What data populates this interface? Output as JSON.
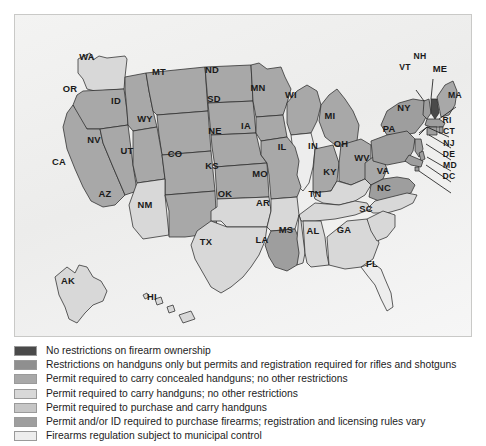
{
  "map": {
    "title": "United States firearm regulation by state",
    "background_color": "#efefee",
    "border_color": "#c9c9c7",
    "outline_color": "#2b2b2b"
  },
  "palette": {
    "c1": "#4a4a4a",
    "c2": "#8f8f8f",
    "c3": "#a8a8a8",
    "c4": "#d8d8d8",
    "c5": "#c6c6c6",
    "c6": "#9e9e9e",
    "c7": "#ededed"
  },
  "legend": {
    "items": [
      {
        "color_key": "c1",
        "label": "No restrictions on firearm ownership"
      },
      {
        "color_key": "c2",
        "label": "Restrictions on handguns only but permits and registration required for rifles and shotguns"
      },
      {
        "color_key": "c3",
        "label": "Permit required to carry concealed handguns; no other restrictions"
      },
      {
        "color_key": "c4",
        "label": "Permit required to carry handguns; no other restrictions"
      },
      {
        "color_key": "c5",
        "label": "Permit required to purchase and carry handguns"
      },
      {
        "color_key": "c6",
        "label": "Permit and/or ID required to purchase firearms; registration and licensing rules vary"
      },
      {
        "color_key": "c7",
        "label": "Firearms regulation subject to municipal control"
      }
    ]
  },
  "chart_data": {
    "type": "map",
    "value_field": "regulation_category",
    "categories": [
      "No restrictions on firearm ownership",
      "Restrictions on handguns only but permits and registration required for rifles and shotguns",
      "Permit required to carry concealed handguns; no other restrictions",
      "Permit required to carry handguns; no other restrictions",
      "Permit required to purchase and carry handguns",
      "Permit and/or ID required to purchase firearms; registration and licensing rules vary",
      "Firearms regulation subject to municipal control"
    ],
    "states": [
      {
        "code": "WA",
        "category": 4
      },
      {
        "code": "OR",
        "category": 3
      },
      {
        "code": "ID",
        "category": 3
      },
      {
        "code": "MT",
        "category": 3
      },
      {
        "code": "WY",
        "category": 3
      },
      {
        "code": "ND",
        "category": 3
      },
      {
        "code": "SD",
        "category": 3
      },
      {
        "code": "MN",
        "category": 3
      },
      {
        "code": "WI",
        "category": 3
      },
      {
        "code": "MI",
        "category": 3
      },
      {
        "code": "CA",
        "category": 3
      },
      {
        "code": "NV",
        "category": 3
      },
      {
        "code": "UT",
        "category": 3
      },
      {
        "code": "CO",
        "category": 3
      },
      {
        "code": "NE",
        "category": 3
      },
      {
        "code": "IA",
        "category": 3
      },
      {
        "code": "IL",
        "category": 7
      },
      {
        "code": "IN",
        "category": 3
      },
      {
        "code": "OH",
        "category": 3
      },
      {
        "code": "AZ",
        "category": 4
      },
      {
        "code": "NM",
        "category": 3
      },
      {
        "code": "KS",
        "category": 3
      },
      {
        "code": "MO",
        "category": 3
      },
      {
        "code": "KY",
        "category": 4
      },
      {
        "code": "WV",
        "category": 3
      },
      {
        "code": "VA",
        "category": 6
      },
      {
        "code": "NC",
        "category": 4
      },
      {
        "code": "TN",
        "category": 4
      },
      {
        "code": "OK",
        "category": 4
      },
      {
        "code": "AR",
        "category": 4
      },
      {
        "code": "TX",
        "category": 4
      },
      {
        "code": "LA",
        "category": 6
      },
      {
        "code": "MS",
        "category": 4
      },
      {
        "code": "AL",
        "category": 4
      },
      {
        "code": "GA",
        "category": 4
      },
      {
        "code": "SC",
        "category": 4
      },
      {
        "code": "FL",
        "category": 7
      },
      {
        "code": "AK",
        "category": 4
      },
      {
        "code": "HI",
        "category": 4
      },
      {
        "code": "NY",
        "category": 6
      },
      {
        "code": "PA",
        "category": 6
      },
      {
        "code": "VT",
        "category": 6
      },
      {
        "code": "NH",
        "category": 1
      },
      {
        "code": "ME",
        "category": 3
      },
      {
        "code": "MA",
        "category": 6
      },
      {
        "code": "RI",
        "category": 6
      },
      {
        "code": "CT",
        "category": 6
      },
      {
        "code": "NJ",
        "category": 6
      },
      {
        "code": "DE",
        "category": 6
      },
      {
        "code": "MD",
        "category": 6
      },
      {
        "code": "DC",
        "category": 6
      }
    ],
    "labels": [
      {
        "code": "WA",
        "x": 87,
        "y": 59
      },
      {
        "code": "OR",
        "x": 70,
        "y": 91
      },
      {
        "code": "ID",
        "x": 116,
        "y": 103
      },
      {
        "code": "MT",
        "x": 159,
        "y": 74
      },
      {
        "code": "ND",
        "x": 212,
        "y": 72
      },
      {
        "code": "SD",
        "x": 214,
        "y": 101
      },
      {
        "code": "MN",
        "x": 258,
        "y": 90
      },
      {
        "code": "WI",
        "x": 291,
        "y": 97
      },
      {
        "code": "MI",
        "x": 330,
        "y": 118
      },
      {
        "code": "WY",
        "x": 145,
        "y": 121
      },
      {
        "code": "NE",
        "x": 215,
        "y": 133
      },
      {
        "code": "IA",
        "x": 246,
        "y": 128
      },
      {
        "code": "NV",
        "x": 94,
        "y": 142
      },
      {
        "code": "UT",
        "x": 127,
        "y": 153
      },
      {
        "code": "CO",
        "x": 175,
        "y": 156
      },
      {
        "code": "IL",
        "x": 282,
        "y": 149
      },
      {
        "code": "IN",
        "x": 313,
        "y": 148
      },
      {
        "code": "OH",
        "x": 341,
        "y": 146
      },
      {
        "code": "CA",
        "x": 59,
        "y": 164
      },
      {
        "code": "KS",
        "x": 212,
        "y": 168
      },
      {
        "code": "MO",
        "x": 260,
        "y": 176
      },
      {
        "code": "KY",
        "x": 330,
        "y": 174
      },
      {
        "code": "WV",
        "x": 362,
        "y": 160
      },
      {
        "code": "VA",
        "x": 383,
        "y": 173
      },
      {
        "code": "AZ",
        "x": 105,
        "y": 196
      },
      {
        "code": "NM",
        "x": 145,
        "y": 207
      },
      {
        "code": "OK",
        "x": 225,
        "y": 196
      },
      {
        "code": "AR",
        "x": 263,
        "y": 205
      },
      {
        "code": "TN",
        "x": 315,
        "y": 196
      },
      {
        "code": "NC",
        "x": 384,
        "y": 190
      },
      {
        "code": "SC",
        "x": 366,
        "y": 211
      },
      {
        "code": "MS",
        "x": 286,
        "y": 232
      },
      {
        "code": "AL",
        "x": 313,
        "y": 233
      },
      {
        "code": "GA",
        "x": 344,
        "y": 232
      },
      {
        "code": "LA",
        "x": 262,
        "y": 242
      },
      {
        "code": "TX",
        "x": 206,
        "y": 244
      },
      {
        "code": "FL",
        "x": 372,
        "y": 266
      },
      {
        "code": "AK",
        "x": 68,
        "y": 283
      },
      {
        "code": "HI",
        "x": 152,
        "y": 299
      },
      {
        "code": "VT",
        "x": 405,
        "y": 69
      },
      {
        "code": "NH",
        "x": 420,
        "y": 58
      },
      {
        "code": "ME",
        "x": 440,
        "y": 71
      },
      {
        "code": "MA",
        "x": 455,
        "y": 97
      },
      {
        "code": "NY",
        "x": 404,
        "y": 110
      },
      {
        "code": "RI",
        "x": 447,
        "y": 122
      },
      {
        "code": "CT",
        "x": 449,
        "y": 133
      },
      {
        "code": "PA",
        "x": 389,
        "y": 131
      },
      {
        "code": "NJ",
        "x": 449,
        "y": 145
      },
      {
        "code": "DE",
        "x": 449,
        "y": 156
      },
      {
        "code": "MD",
        "x": 450,
        "y": 167
      },
      {
        "code": "DC",
        "x": 449,
        "y": 178
      }
    ]
  }
}
